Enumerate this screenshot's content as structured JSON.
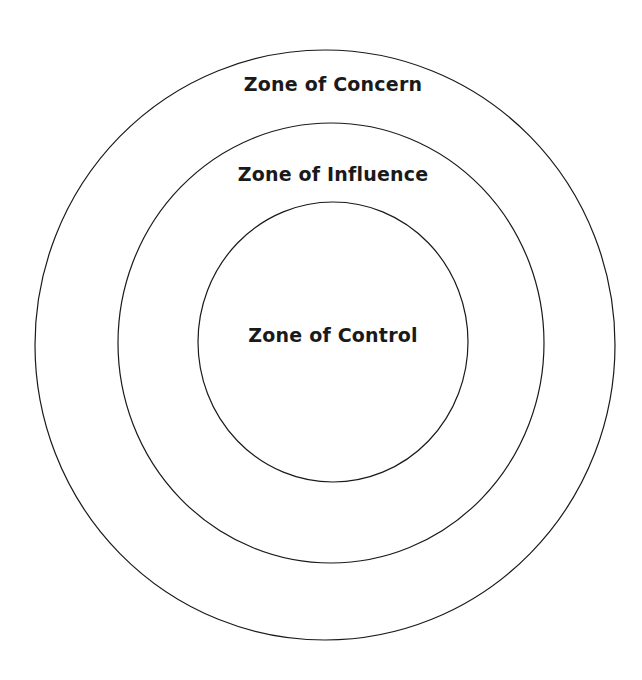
{
  "diagram": {
    "type": "concentric-circles",
    "zones": [
      {
        "id": "concern",
        "label": "Zone of Concern"
      },
      {
        "id": "influence",
        "label": "Zone of Influence"
      },
      {
        "id": "control",
        "label": "Zone of Control"
      }
    ],
    "colors": {
      "stroke": "#1a1a1a",
      "text": "#1a1a1a",
      "background": "#ffffff"
    }
  }
}
